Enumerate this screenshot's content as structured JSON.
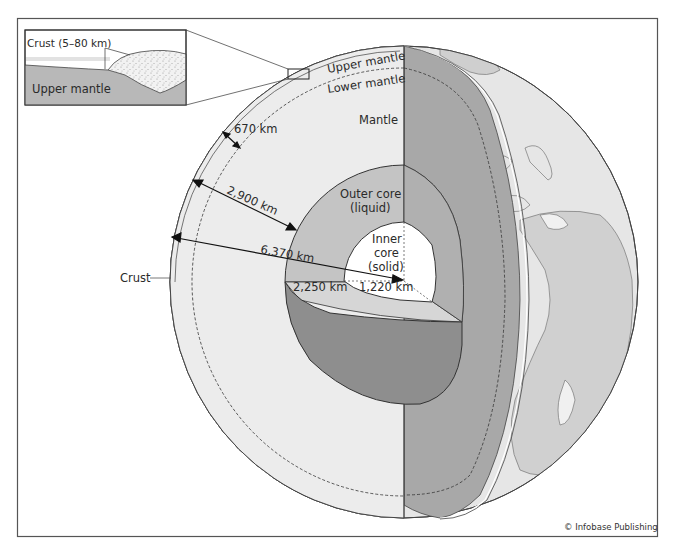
{
  "figure": {
    "credit": "© Infobase Publishing"
  },
  "inset": {
    "crust_label": "Crust (5–80 km)",
    "mantle_label": "Upper mantle"
  },
  "layers": {
    "upper_mantle": "Upper mantle",
    "lower_mantle": "Lower mantle",
    "mantle": "Mantle",
    "outer_core_line1": "Outer core",
    "outer_core_line2": "(liquid)",
    "inner_core_line1": "Inner",
    "inner_core_line2": "core",
    "inner_core_line3": "(solid)",
    "crust": "Crust"
  },
  "measurements": {
    "upper_mantle_depth": "670 km",
    "mantle_depth": "2,900 km",
    "earth_radius": "6,370 km",
    "outer_core_thickness": "2,250 km",
    "inner_core_radius": "1,220 km"
  },
  "colors": {
    "frame": "#555555",
    "mantle_face": "#ececec",
    "outer_core": "#c4c4c4",
    "inner_core": "#ffffff",
    "wedge_dark": "#8e8e8e",
    "side_cut": "#a6a6a6",
    "globe_surface": "#dedede",
    "inset_mantle": "#b8b8b8"
  }
}
